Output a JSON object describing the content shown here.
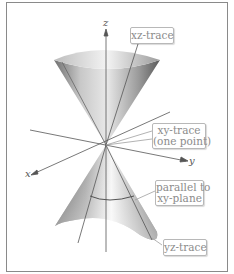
{
  "figure": {
    "axes": {
      "x": "x",
      "y": "y",
      "z": "z"
    },
    "labels": {
      "xz_trace": "xz-trace",
      "xy_trace_line1": "xy-trace",
      "xy_trace_line2": "(one point)",
      "parallel_line1": "parallel to",
      "parallel_line2": "xy-plane",
      "yz_trace": "yz-trace"
    },
    "colors": {
      "frame": "#8a8a8a",
      "label_text": "#8c8c8c",
      "axis": "#555555"
    }
  }
}
